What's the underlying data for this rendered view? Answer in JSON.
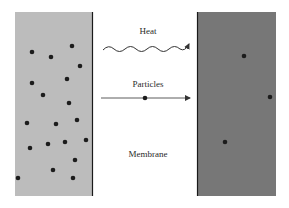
{
  "diagram": {
    "labels": {
      "heat": "Heat",
      "particles": "Particles",
      "membrane": "Membrane"
    },
    "colors": {
      "left_chamber": "#bcbcbc",
      "right_chamber": "#777777",
      "membrane_line": "#1a1a1a",
      "particle": "#1c1c1c",
      "arrow": "#333333"
    },
    "left_chamber": {
      "description": "High concentration region",
      "particle_count": 19
    },
    "right_chamber": {
      "description": "Low concentration region",
      "particle_count": 3
    }
  }
}
